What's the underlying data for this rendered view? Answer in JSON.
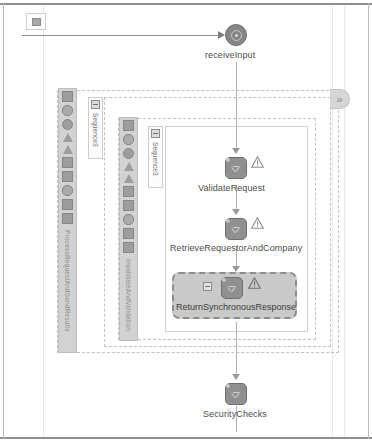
{
  "canvas": {
    "width": 372,
    "height": 441,
    "background": "#ffffff",
    "line_color": "#8d8d8d",
    "node_fill": "#909090",
    "selection_fill": "#c9c9c9",
    "selection_border": "#8c8c8c"
  },
  "start_marker": {
    "name": "start-marker"
  },
  "nodes": [
    {
      "id": "receiveInput",
      "label": "receiveInput",
      "type": "receive",
      "has_warning": false,
      "selected": false
    },
    {
      "id": "ValidateRequest",
      "label": "ValidateRequest",
      "type": "activity",
      "has_warning": true,
      "selected": false
    },
    {
      "id": "RetrieveRequestorAndCompany",
      "label": "RetrieveRequestorAndCompany",
      "type": "activity",
      "has_warning": true,
      "selected": false
    },
    {
      "id": "ReturnSynchronousResponse",
      "label": "ReturnSynchronousResponse",
      "type": "activity",
      "has_warning": true,
      "selected": true
    },
    {
      "id": "SecurityChecks",
      "label": "SecurityChecks",
      "type": "activity",
      "has_warning": false,
      "selected": false
    }
  ],
  "scopes": [
    {
      "id": "outer-scope",
      "palette_label": "ProcessRequestAndSendResults"
    },
    {
      "id": "inner-scope",
      "palette_label": "InvalidateAndValidation"
    }
  ],
  "sequences": [
    {
      "id": "outer-sequence",
      "label": "Sequence3"
    },
    {
      "id": "inner-sequence",
      "label": "Sequence3"
    }
  ],
  "palette_icons": [
    "collapse-icon",
    "binoculars-icon",
    "circle-icon",
    "triangle-icon",
    "triangle-alt-icon",
    "box-icon",
    "lightning-icon",
    "binoculars-alt-icon",
    "box-alt-icon",
    "network-icon"
  ],
  "expand_handle": {
    "glyph": "»",
    "name": "expand-right-handle"
  },
  "warning_glyph": "!"
}
